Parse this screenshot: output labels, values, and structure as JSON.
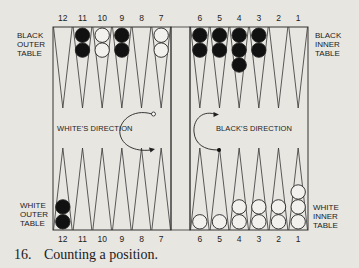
{
  "labels": {
    "black_outer": [
      "BLACK",
      "OUTER",
      "TABLE"
    ],
    "black_inner": [
      "BLACK",
      "INNER",
      "TABLE"
    ],
    "white_outer": [
      "WHITE",
      "OUTER",
      "TABLE"
    ],
    "white_inner": [
      "WHITE",
      "INNER",
      "TABLE"
    ],
    "white_direction": "WHITE'S DIRECTION",
    "black_direction": "BLACK'S DIRECTION"
  },
  "point_numbers": {
    "left": [
      "12",
      "11",
      "10",
      "9",
      "8",
      "7"
    ],
    "right": [
      "6",
      "5",
      "4",
      "3",
      "2",
      "1"
    ]
  },
  "position": {
    "top": [
      {
        "point": 12,
        "color": null,
        "count": 0
      },
      {
        "point": 11,
        "color": "black",
        "count": 2
      },
      {
        "point": 10,
        "color": "white",
        "count": 2
      },
      {
        "point": 9,
        "color": "black",
        "count": 2
      },
      {
        "point": 8,
        "color": null,
        "count": 0
      },
      {
        "point": 7,
        "color": "white",
        "count": 2
      },
      {
        "point": 6,
        "color": "black",
        "count": 2
      },
      {
        "point": 5,
        "color": "black",
        "count": 2
      },
      {
        "point": 4,
        "color": "black",
        "count": 3
      },
      {
        "point": 3,
        "color": "black",
        "count": 2
      },
      {
        "point": 2,
        "color": null,
        "count": 0
      },
      {
        "point": 1,
        "color": null,
        "count": 0
      }
    ],
    "bottom": [
      {
        "point": 12,
        "color": "black",
        "count": 2
      },
      {
        "point": 11,
        "color": null,
        "count": 0
      },
      {
        "point": 10,
        "color": null,
        "count": 0
      },
      {
        "point": 9,
        "color": null,
        "count": 0
      },
      {
        "point": 8,
        "color": null,
        "count": 0
      },
      {
        "point": 7,
        "color": null,
        "count": 0
      },
      {
        "point": 6,
        "color": "white",
        "count": 1
      },
      {
        "point": 5,
        "color": "white",
        "count": 1
      },
      {
        "point": 4,
        "color": "white",
        "count": 2
      },
      {
        "point": 3,
        "color": "white",
        "count": 2
      },
      {
        "point": 2,
        "color": "white",
        "count": 2
      },
      {
        "point": 1,
        "color": "white",
        "count": 3
      }
    ]
  },
  "caption": {
    "number": "16.",
    "text": "Counting a position."
  }
}
